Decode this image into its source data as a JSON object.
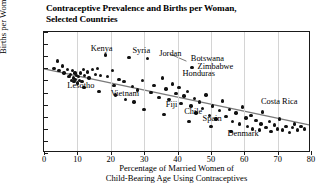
{
  "chart_data": {
    "type": "scatter",
    "title": "Contraceptive Prevalence and Births per Woman, Selected Countries",
    "title_line1": "Contraceptive Prevalence and Births per Woman,",
    "title_line2": "Selected Countries",
    "xlabel": "Percentage of Married Women of Child-Bearing Age Using Contraceptives",
    "xlabel_line1": "Percentage of Married Women of",
    "xlabel_line2": "Child-Bearing Age Using Contraceptives",
    "ylabel": "Births per Woman",
    "xlim": [
      0,
      80
    ],
    "ylim": [
      0,
      10
    ],
    "xticks": [
      0,
      10,
      20,
      30,
      40,
      50,
      60,
      70,
      80
    ],
    "yticks": [
      0,
      1,
      2,
      3,
      4,
      5,
      6,
      7,
      8,
      9,
      10
    ],
    "grid": "vertical",
    "legend": "none",
    "marker_color": "#111111",
    "trendline": {
      "color": "#7a7a7a",
      "x": [
        0,
        80
      ],
      "y": [
        6.9,
        2.2
      ]
    },
    "points": [
      [
        3.0,
        7.0
      ],
      [
        4.5,
        6.8
      ],
      [
        5.5,
        7.2
      ],
      [
        6.0,
        6.6
      ],
      [
        7.0,
        6.9
      ],
      [
        7.5,
        6.3
      ],
      [
        8.0,
        6.5
      ],
      [
        8.2,
        6.0
      ],
      [
        8.5,
        6.8
      ],
      [
        8.8,
        6.2
      ],
      [
        9.0,
        5.9
      ],
      [
        9.3,
        6.6
      ],
      [
        9.5,
        6.1
      ],
      [
        9.8,
        6.4
      ],
      [
        10.0,
        5.8
      ],
      [
        10.3,
        6.3
      ],
      [
        10.6,
        6.0
      ],
      [
        11.0,
        6.6
      ],
      [
        11.4,
        5.9
      ],
      [
        11.8,
        6.9
      ],
      [
        12.2,
        6.4
      ],
      [
        13.0,
        6.7
      ],
      [
        13.5,
        6.2
      ],
      [
        14.5,
        6.9
      ],
      [
        15.5,
        6.5
      ],
      [
        16.0,
        7.0
      ],
      [
        17.0,
        6.4
      ],
      [
        18.5,
        8.1
      ],
      [
        19.0,
        6.3
      ],
      [
        20.5,
        6.8
      ],
      [
        21.0,
        5.6
      ],
      [
        22.5,
        6.1
      ],
      [
        24.0,
        5.9
      ],
      [
        25.5,
        7.9
      ],
      [
        26.5,
        5.5
      ],
      [
        28.0,
        5.2
      ],
      [
        29.5,
        6.0
      ],
      [
        31.0,
        7.8
      ],
      [
        32.0,
        5.0
      ],
      [
        33.0,
        5.6
      ],
      [
        34.5,
        4.6
      ],
      [
        35.5,
        6.2
      ],
      [
        36.5,
        5.3
      ],
      [
        37.5,
        4.4
      ],
      [
        38.5,
        5.7
      ],
      [
        39.5,
        4.9
      ],
      [
        40.5,
        5.4
      ],
      [
        41.0,
        4.1
      ],
      [
        42.0,
        4.7
      ],
      [
        43.0,
        5.1
      ],
      [
        44.0,
        3.9
      ],
      [
        45.0,
        4.5
      ],
      [
        45.5,
        3.3
      ],
      [
        46.5,
        4.2
      ],
      [
        47.5,
        3.7
      ],
      [
        48.5,
        4.8
      ],
      [
        49.5,
        3.1
      ],
      [
        50.5,
        3.9
      ],
      [
        51.5,
        2.8
      ],
      [
        52.5,
        3.5
      ],
      [
        53.5,
        4.3
      ],
      [
        54.5,
        3.0
      ],
      [
        55.5,
        3.6
      ],
      [
        56.5,
        2.6
      ],
      [
        57.5,
        3.3
      ],
      [
        58.5,
        2.4
      ],
      [
        59.5,
        3.8
      ],
      [
        60.5,
        2.9
      ],
      [
        61.0,
        2.2
      ],
      [
        62.0,
        3.1
      ],
      [
        62.5,
        2.0
      ],
      [
        63.5,
        2.7
      ],
      [
        64.5,
        1.9
      ],
      [
        65.0,
        2.4
      ],
      [
        65.5,
        3.4
      ],
      [
        66.5,
        2.1
      ],
      [
        67.5,
        2.6
      ],
      [
        68.0,
        1.8
      ],
      [
        69.0,
        2.3
      ],
      [
        70.0,
        2.0
      ],
      [
        70.5,
        2.8
      ],
      [
        71.5,
        1.9
      ],
      [
        72.5,
        2.2
      ],
      [
        73.5,
        1.7
      ],
      [
        74.5,
        2.1
      ],
      [
        75.0,
        2.4
      ],
      [
        76.0,
        1.9
      ],
      [
        77.0,
        2.2
      ],
      [
        78.0,
        2.0
      ],
      [
        24.5,
        4.4
      ],
      [
        30.0,
        3.6
      ],
      [
        36.0,
        3.2
      ],
      [
        43.5,
        2.6
      ],
      [
        50.0,
        2.2
      ],
      [
        56.0,
        1.8
      ],
      [
        12.0,
        5.4
      ],
      [
        16.5,
        5.1
      ],
      [
        21.5,
        4.8
      ],
      [
        27.0,
        4.2
      ],
      [
        4.0,
        7.6
      ]
    ],
    "annotations": [
      {
        "label": "Kenya",
        "x": 14.0,
        "y": 8.6
      },
      {
        "label": "Syria",
        "x": 26.5,
        "y": 8.4
      },
      {
        "label": "Jordan",
        "x": 34.5,
        "y": 8.2
      },
      {
        "label": "Botswana",
        "x": 44.0,
        "y": 7.8
      },
      {
        "label": "Zimbabwe",
        "x": 46.0,
        "y": 7.1
      },
      {
        "label": "Honduras",
        "x": 41.5,
        "y": 6.5
      },
      {
        "label": "Lesotho",
        "x": 7.0,
        "y": 5.5
      },
      {
        "label": "Vietnam",
        "x": 20.0,
        "y": 4.9
      },
      {
        "label": "Fiji",
        "x": 36.5,
        "y": 4.0
      },
      {
        "label": "Chile",
        "x": 42.0,
        "y": 3.4
      },
      {
        "label": "Spain",
        "x": 47.5,
        "y": 2.8
      },
      {
        "label": "Denmark",
        "x": 55.0,
        "y": 1.6
      },
      {
        "label": "Costa Rica",
        "x": 65.0,
        "y": 4.2
      }
    ]
  }
}
